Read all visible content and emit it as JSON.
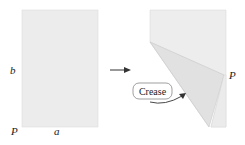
{
  "diagram": {
    "left_figure": {
      "labels": {
        "side_vertical": "b",
        "side_horizontal": "a",
        "corner": "P"
      }
    },
    "right_figure": {
      "labels": {
        "corner": "P",
        "callout": "Crease"
      }
    },
    "colors": {
      "paper": "#ececec",
      "folded_flap": "#e2e2e2",
      "edge": "#c8c8c8",
      "text": "#222222",
      "arrow": "#333333"
    }
  }
}
